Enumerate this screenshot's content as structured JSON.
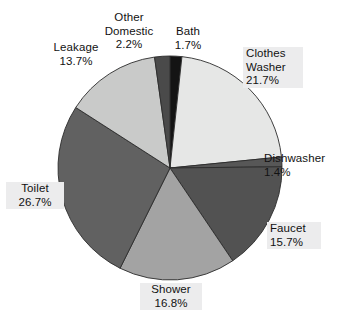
{
  "chart_data": {
    "type": "pie",
    "title": "",
    "subtitle": "",
    "xlabel": "",
    "ylabel": "",
    "legend": "none",
    "grid": false,
    "units": "percent",
    "start_angle_deg": 0,
    "direction": "clockwise",
    "categories": [
      "Bath",
      "Clothes Washer",
      "Dishwasher",
      "Faucet",
      "Shower",
      "Toilet",
      "Leakage",
      "Other Domestic"
    ],
    "values": [
      1.7,
      21.7,
      1.4,
      15.7,
      16.8,
      26.7,
      13.7,
      2.2
    ],
    "colors": [
      "#141414",
      "#e6e7e6",
      "#575757",
      "#525252",
      "#a3a3a3",
      "#616161",
      "#c9cac9",
      "#4a4a4a"
    ],
    "slices": [
      {
        "label": "Bath",
        "value": 1.7,
        "value_text": "1.7%",
        "color": "#141414",
        "boxed_label": false
      },
      {
        "label": "Clothes Washer",
        "value": 21.7,
        "value_text": "21.7%",
        "color": "#e6e7e6",
        "boxed_label": true
      },
      {
        "label": "Dishwasher",
        "value": 1.4,
        "value_text": "1.4%",
        "color": "#575757",
        "boxed_label": false
      },
      {
        "label": "Faucet",
        "value": 15.7,
        "value_text": "15.7%",
        "color": "#525252",
        "boxed_label": true
      },
      {
        "label": "Shower",
        "value": 16.8,
        "value_text": "16.8%",
        "color": "#a3a3a3",
        "boxed_label": true
      },
      {
        "label": "Toilet",
        "value": 26.7,
        "value_text": "26.7%",
        "color": "#616161",
        "boxed_label": true
      },
      {
        "label": "Leakage",
        "value": 13.7,
        "value_text": "13.7%",
        "color": "#c9cac9",
        "boxed_label": false
      },
      {
        "label": "Other Domestic",
        "value": 2.2,
        "value_text": "2.2%",
        "color": "#4a4a4a",
        "boxed_label": false
      }
    ]
  },
  "labels": {
    "other_domestic": {
      "line1": "Other",
      "line2": "Domestic",
      "value": "2.2%"
    },
    "bath": {
      "line1": "Bath",
      "value": "1.7%"
    },
    "leakage": {
      "line1": "Leakage",
      "value": "13.7%"
    },
    "clothes_washer": {
      "line1": "Clothes",
      "line2": "Washer",
      "value": "21.7%"
    },
    "dishwasher": {
      "line1": "Dishwasher",
      "value": "1.4%"
    },
    "faucet": {
      "line1": "Faucet",
      "value": "15.7%"
    },
    "toilet": {
      "line1": "Toilet",
      "value": "26.7%"
    },
    "shower": {
      "line1": "Shower",
      "value": "16.8%"
    }
  },
  "geometry": {
    "center_x": 170,
    "center_y": 168,
    "radius": 112,
    "stroke": "#2b2b2b",
    "stroke_width": 0.9
  }
}
